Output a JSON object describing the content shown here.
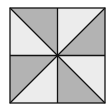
{
  "diagram": {
    "type": "pinwheel-square",
    "square": {
      "x": 10,
      "y": 8,
      "size": 95
    },
    "colors": {
      "dark": "#b3b3b3",
      "light": "#ececec",
      "stroke": "#111111"
    },
    "triangles": [
      {
        "id": "top-left-upper",
        "fill": "dark"
      },
      {
        "id": "top-left-lower",
        "fill": "light"
      },
      {
        "id": "top-right-upper",
        "fill": "light"
      },
      {
        "id": "top-right-lower",
        "fill": "dark"
      },
      {
        "id": "bottom-left-upper",
        "fill": "dark"
      },
      {
        "id": "bottom-left-lower",
        "fill": "light"
      },
      {
        "id": "bottom-right-upper",
        "fill": "light"
      },
      {
        "id": "bottom-right-lower",
        "fill": "dark"
      }
    ]
  },
  "caption": ""
}
